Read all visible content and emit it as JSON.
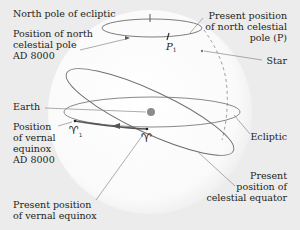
{
  "cut_title": "Earth's axis...",
  "labels": {
    "north_pole_ecliptic": "North pole of ecliptic",
    "north_celestial_8000": [
      "Position of north",
      "celestial pole",
      "AD 8000"
    ],
    "present_north_pole": [
      "Present position",
      "of north celestial",
      "pole (P)"
    ],
    "star": "Star",
    "earth": "Earth",
    "vernal_8000": [
      "Position",
      "of vernal",
      "equinox",
      "AD 8000"
    ],
    "ecliptic": "Ecliptic",
    "present_equator": [
      "Present",
      "position of",
      "celestial equator"
    ],
    "present_vernal": [
      "Present position",
      "of vernal equinox"
    ],
    "p1_symbol": "P",
    "p1_subscript": "1",
    "aries_symbol": "♈",
    "aries1_subscript": "1"
  },
  "colors": {
    "background": "#ececec",
    "sphere": "#ffffff",
    "line": "#6d6d6d",
    "leader": "#8a8a8a",
    "earth": "#8c8c8c",
    "text": "#231f20"
  }
}
